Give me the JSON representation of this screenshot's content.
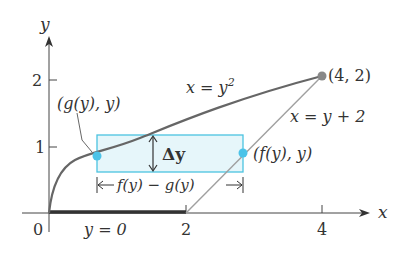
{
  "diagram": {
    "axes": {
      "x_label": "x",
      "y_label": "y",
      "origin_label": "0",
      "x_ticks": [
        {
          "value": 2,
          "label": "2"
        },
        {
          "value": 4,
          "label": "4"
        }
      ],
      "y_ticks": [
        {
          "value": 1,
          "label": "1"
        },
        {
          "value": 2,
          "label": "2"
        }
      ]
    },
    "curves": {
      "parabola_label": "x = y",
      "parabola_exponent": "2",
      "line_label": "x = y + 2",
      "baseline_label": "y = 0"
    },
    "points": {
      "intersection": "(4, 2)",
      "left_point": "(g(y), y)",
      "right_point": "(f(y), y)"
    },
    "strip": {
      "height_label": "Δy",
      "width_label": "f(y) − g(y)"
    },
    "colors": {
      "curve": "#666666",
      "line": "#999999",
      "axis": "#444444",
      "strip_fill": "#e6f6fa",
      "strip_stroke": "#4cc3e0",
      "dot": "#4cc3e8",
      "baseline": "#333333"
    }
  }
}
